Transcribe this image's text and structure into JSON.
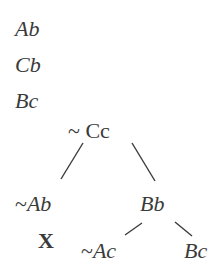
{
  "premises": [
    "Ab",
    "Cb",
    "Bc"
  ],
  "tree": {
    "root": {
      "label": "~ Cc",
      "prefix": "~",
      "term": "Cc"
    },
    "left": {
      "label": "~Ab",
      "prefix": "~",
      "term": "Ab"
    },
    "left_marker": "X",
    "right": {
      "label": "Bb",
      "term": "Bb"
    },
    "right_left": {
      "label": "~Ac",
      "prefix": "~",
      "term": "Ac"
    },
    "right_right": {
      "label": "Bc",
      "term": "Bc"
    }
  },
  "colors": {
    "ink": "#3a3a3a",
    "background": "#ffffff"
  }
}
